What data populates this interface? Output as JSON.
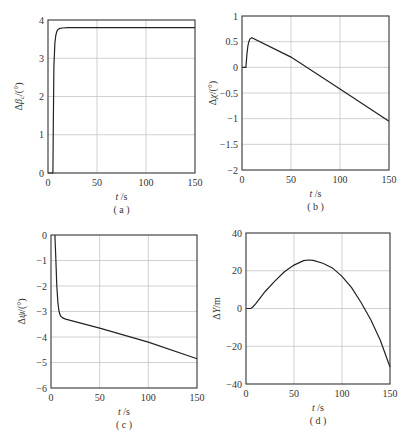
{
  "figure": {
    "bottom_caption": "",
    "panels": [
      "a",
      "b",
      "c",
      "d"
    ]
  },
  "chart_data": [
    {
      "id": "a",
      "type": "line",
      "caption": "( a )",
      "xlabel": "t /s",
      "ylabel": "Δβ_c/(°)",
      "xlim": [
        0,
        150
      ],
      "ylim": [
        0,
        4
      ],
      "xticks": [
        0,
        50,
        100,
        150
      ],
      "yticks": [
        0,
        1,
        2,
        3,
        4
      ],
      "grid": true,
      "box": {
        "left": 48,
        "top": 20,
        "right": 195,
        "bottom": 173
      },
      "series": [
        {
          "name": "Δβc",
          "x": [
            0,
            5,
            5.5,
            6,
            7,
            8,
            9,
            10,
            12,
            15,
            20,
            50,
            100,
            150
          ],
          "y": [
            0,
            0,
            1.5,
            2.8,
            3.4,
            3.6,
            3.7,
            3.75,
            3.78,
            3.79,
            3.8,
            3.8,
            3.8,
            3.8
          ]
        }
      ]
    },
    {
      "id": "b",
      "type": "line",
      "caption": "( b )",
      "xlabel": "t /s",
      "ylabel": "Δχ/(°)",
      "xlim": [
        0,
        150
      ],
      "ylim": [
        -2,
        1
      ],
      "xticks": [
        0,
        50,
        100,
        150
      ],
      "yticks": [
        -2,
        -1.5,
        -1,
        -0.5,
        0,
        0.5,
        1
      ],
      "grid": true,
      "box": {
        "left": 242,
        "top": 16,
        "right": 389,
        "bottom": 170
      },
      "series": [
        {
          "name": "Δχ",
          "x": [
            0,
            4,
            5,
            6,
            7,
            8,
            10,
            50,
            100,
            150
          ],
          "y": [
            0,
            0,
            0.25,
            0.42,
            0.5,
            0.55,
            0.58,
            0.2,
            -0.42,
            -1.05
          ]
        }
      ]
    },
    {
      "id": "c",
      "type": "line",
      "caption": "( c )",
      "xlabel": "t /s",
      "ylabel": "Δψ/(°)",
      "xlim": [
        0,
        150
      ],
      "ylim": [
        -6,
        0
      ],
      "xticks": [
        0,
        50,
        100,
        150
      ],
      "yticks": [
        -6,
        -5,
        -4,
        -3,
        -2,
        -1,
        0
      ],
      "grid": true,
      "box": {
        "left": 51,
        "top": 235,
        "right": 197,
        "bottom": 388
      },
      "series": [
        {
          "name": "Δψ",
          "x": [
            4,
            5,
            6,
            7,
            8,
            9,
            10,
            12,
            15,
            50,
            100,
            150
          ],
          "y": [
            0,
            -1.0,
            -2.0,
            -2.6,
            -2.95,
            -3.1,
            -3.18,
            -3.25,
            -3.3,
            -3.65,
            -4.2,
            -4.85
          ]
        }
      ]
    },
    {
      "id": "d",
      "type": "line",
      "caption": "( d )",
      "xlabel": "t /s",
      "ylabel": "ΔY/m",
      "xlim": [
        0,
        150
      ],
      "ylim": [
        -40,
        40
      ],
      "xticks": [
        0,
        50,
        100,
        150
      ],
      "yticks": [
        -40,
        -20,
        0,
        20,
        40
      ],
      "grid": true,
      "box": {
        "left": 246,
        "top": 233,
        "right": 390,
        "bottom": 384
      },
      "series": [
        {
          "name": "ΔY",
          "x": [
            0,
            5,
            7,
            10,
            20,
            30,
            40,
            50,
            60,
            65,
            70,
            80,
            90,
            100,
            110,
            120,
            130,
            140,
            150
          ],
          "y": [
            0,
            0,
            0.8,
            2.5,
            9,
            14.5,
            19.5,
            23,
            25.3,
            25.7,
            25.5,
            24,
            21.5,
            17,
            11,
            3,
            -6,
            -17,
            -31
          ]
        }
      ]
    }
  ]
}
